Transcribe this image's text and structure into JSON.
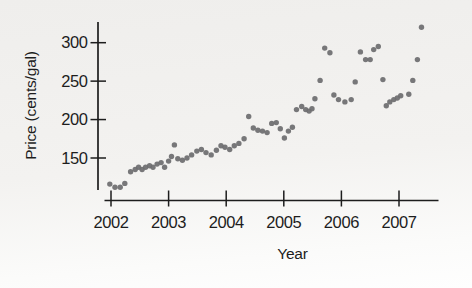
{
  "figure": {
    "background_top": "#efeeec",
    "background_bottom": "#fefefe"
  },
  "chart_data": {
    "type": "scatter",
    "title": "",
    "xlabel": "Year",
    "ylabel": "Price (cents/gal)",
    "x_tick_labels": [
      "2002",
      "2003",
      "2004",
      "2005",
      "2006",
      "2007"
    ],
    "y_tick_labels": [
      "150",
      "200",
      "250",
      "300"
    ],
    "xlim": [
      2001.88,
      2007.68
    ],
    "ylim": [
      105,
      330
    ],
    "grid": false,
    "legend": "none",
    "point_color": "#6c6c6f",
    "axis_color": "#1d1d1d",
    "points": [
      [
        2001.98,
        116
      ],
      [
        2002.07,
        112
      ],
      [
        2002.16,
        112
      ],
      [
        2002.24,
        117
      ],
      [
        2002.34,
        132
      ],
      [
        2002.42,
        135
      ],
      [
        2002.48,
        138
      ],
      [
        2002.54,
        135
      ],
      [
        2002.6,
        138
      ],
      [
        2002.67,
        140
      ],
      [
        2002.73,
        138
      ],
      [
        2002.8,
        142
      ],
      [
        2002.87,
        144
      ],
      [
        2002.93,
        138
      ],
      [
        2003.0,
        146
      ],
      [
        2003.05,
        152
      ],
      [
        2003.1,
        167
      ],
      [
        2003.16,
        149
      ],
      [
        2003.24,
        147
      ],
      [
        2003.32,
        150
      ],
      [
        2003.4,
        154
      ],
      [
        2003.49,
        159
      ],
      [
        2003.57,
        161
      ],
      [
        2003.65,
        157
      ],
      [
        2003.74,
        154
      ],
      [
        2003.83,
        160
      ],
      [
        2003.91,
        166
      ],
      [
        2003.98,
        164
      ],
      [
        2004.06,
        161
      ],
      [
        2004.14,
        166
      ],
      [
        2004.22,
        169
      ],
      [
        2004.31,
        175
      ],
      [
        2004.39,
        204
      ],
      [
        2004.47,
        189
      ],
      [
        2004.55,
        186
      ],
      [
        2004.63,
        185
      ],
      [
        2004.71,
        183
      ],
      [
        2004.79,
        195
      ],
      [
        2004.87,
        196
      ],
      [
        2004.94,
        188
      ],
      [
        2005.01,
        176
      ],
      [
        2005.08,
        185
      ],
      [
        2005.15,
        190
      ],
      [
        2005.22,
        213
      ],
      [
        2005.31,
        217
      ],
      [
        2005.38,
        213
      ],
      [
        2005.44,
        211
      ],
      [
        2005.49,
        214
      ],
      [
        2005.54,
        227
      ],
      [
        2005.63,
        251
      ],
      [
        2005.71,
        293
      ],
      [
        2005.8,
        287
      ],
      [
        2005.87,
        232
      ],
      [
        2005.95,
        226
      ],
      [
        2006.06,
        223
      ],
      [
        2006.17,
        226
      ],
      [
        2006.24,
        249
      ],
      [
        2006.33,
        288
      ],
      [
        2006.42,
        278
      ],
      [
        2006.5,
        278
      ],
      [
        2006.56,
        291
      ],
      [
        2006.64,
        295
      ],
      [
        2006.72,
        252
      ],
      [
        2006.78,
        218
      ],
      [
        2006.84,
        223
      ],
      [
        2006.91,
        226
      ],
      [
        2006.97,
        228
      ],
      [
        2007.03,
        231
      ],
      [
        2007.17,
        233
      ],
      [
        2007.24,
        251
      ],
      [
        2007.32,
        278
      ],
      [
        2007.39,
        320
      ]
    ]
  }
}
